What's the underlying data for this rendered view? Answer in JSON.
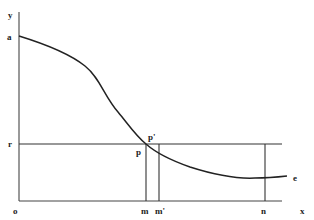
{
  "diagram": {
    "type": "economic-curve-diagram",
    "axes": {
      "origin_label": "o",
      "x_label": "x",
      "y_label": "y"
    },
    "curve": {
      "start_label": "a",
      "end_label": "e"
    },
    "horizontal_line": {
      "label": "r"
    },
    "points": {
      "p_label": "p",
      "p_prime_label": "p'"
    },
    "x_ticks": {
      "m": "m",
      "m_prime": "m'",
      "n": "n"
    },
    "colors": {
      "line": "#222222",
      "axis": "#444444",
      "background": "#ffffff"
    }
  }
}
